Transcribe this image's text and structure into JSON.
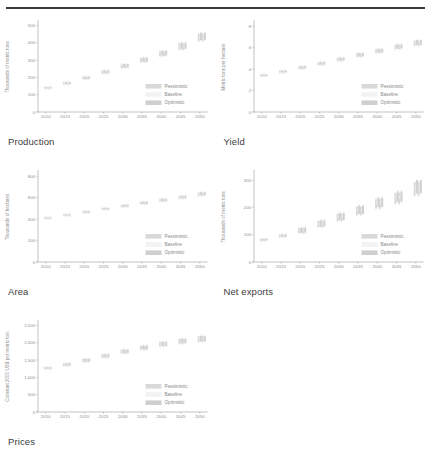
{
  "figure": {
    "panels": [
      {
        "id": "production",
        "caption": "Production",
        "ylabel": "Thousands of metric tons"
      },
      {
        "id": "yield",
        "caption": "Yield",
        "ylabel": "Metric tons per hectare"
      },
      {
        "id": "area",
        "caption": "Area",
        "ylabel": "Thousands of hectares"
      },
      {
        "id": "net_exports",
        "caption": "Net exports",
        "ylabel": "Thousands of metric tons"
      },
      {
        "id": "prices",
        "caption": "Prices",
        "ylabel": "Constant 2000 US$ per metric ton"
      }
    ],
    "legend": {
      "pessimistic": "Pessimistic",
      "baseline": "Baseline",
      "optimistic": "Optimistic"
    },
    "colors": {
      "pessimistic": "#d9d9d9",
      "baseline": "#f2f2f2",
      "optimistic": "#cfcfcf",
      "axis": "#a9a9a9",
      "text": "#8e8e8e",
      "rule": "#3a3a3a"
    }
  },
  "chart_data": [
    {
      "type": "bar",
      "id": "production",
      "title": "Production",
      "xlabel": "",
      "ylabel": "Thousands of metric tons",
      "xticks": [
        2010,
        2015,
        2020,
        2025,
        2030,
        2035,
        2040,
        2045,
        2050
      ],
      "yticks": [
        0,
        100,
        200,
        300,
        400,
        500
      ],
      "xlim": [
        2008,
        2052
      ],
      "ylim": [
        0,
        520
      ],
      "grid": false,
      "legend_position": "bottom-right",
      "x": [
        2010,
        2011,
        2015,
        2016,
        2020,
        2021,
        2025,
        2026,
        2030,
        2031,
        2035,
        2036,
        2040,
        2041,
        2045,
        2046,
        2050,
        2051
      ],
      "series": [
        {
          "name": "Pessimistic",
          "low": [
            136,
            136,
            160,
            160,
            190,
            190,
            222,
            222,
            255,
            255,
            288,
            288,
            322,
            322,
            360,
            360,
            410,
            410
          ],
          "high": [
            142,
            142,
            170,
            170,
            202,
            202,
            238,
            238,
            274,
            274,
            310,
            310,
            350,
            350,
            396,
            396,
            452,
            452
          ]
        },
        {
          "name": "Baseline",
          "low": [
            138,
            138,
            164,
            164,
            195,
            195,
            228,
            228,
            262,
            262,
            296,
            296,
            331,
            331,
            372,
            372,
            424,
            424
          ],
          "high": [
            141,
            141,
            168,
            168,
            200,
            200,
            234,
            234,
            269,
            269,
            304,
            304,
            341,
            341,
            384,
            384,
            438,
            438
          ]
        },
        {
          "name": "Optimistic",
          "low": [
            137,
            137,
            162,
            162,
            192,
            192,
            225,
            225,
            258,
            258,
            292,
            292,
            327,
            327,
            366,
            366,
            416,
            416
          ],
          "high": [
            143,
            143,
            172,
            172,
            204,
            204,
            240,
            240,
            277,
            277,
            314,
            314,
            354,
            354,
            401,
            401,
            458,
            458
          ]
        }
      ]
    },
    {
      "type": "bar",
      "id": "yield",
      "title": "Yield",
      "xlabel": "",
      "ylabel": "Metric tons per hectare",
      "xticks": [
        2010,
        2015,
        2020,
        2025,
        2030,
        2035,
        2040,
        2045,
        2050
      ],
      "yticks": [
        0,
        0.2,
        0.4,
        0.6,
        0.8
      ],
      "ytick_labels": [
        "0",
        ".2",
        ".4",
        ".6",
        ".8"
      ],
      "xlim": [
        2008,
        2052
      ],
      "ylim": [
        0,
        0.84
      ],
      "grid": false,
      "legend_position": "bottom-right",
      "x": [
        2010,
        2011,
        2015,
        2016,
        2020,
        2021,
        2025,
        2026,
        2030,
        2031,
        2035,
        2036,
        2040,
        2041,
        2045,
        2046,
        2050,
        2051
      ],
      "series": [
        {
          "name": "Pessimistic",
          "low": [
            0.335,
            0.335,
            0.368,
            0.368,
            0.404,
            0.404,
            0.44,
            0.44,
            0.478,
            0.478,
            0.516,
            0.516,
            0.552,
            0.552,
            0.588,
            0.588,
            0.62,
            0.62
          ],
          "high": [
            0.347,
            0.347,
            0.384,
            0.384,
            0.424,
            0.424,
            0.462,
            0.462,
            0.502,
            0.502,
            0.544,
            0.544,
            0.584,
            0.584,
            0.624,
            0.624,
            0.664,
            0.664
          ]
        },
        {
          "name": "Baseline",
          "low": [
            0.339,
            0.339,
            0.374,
            0.374,
            0.411,
            0.411,
            0.448,
            0.448,
            0.487,
            0.487,
            0.526,
            0.526,
            0.564,
            0.564,
            0.601,
            0.601,
            0.635,
            0.635
          ],
          "high": [
            0.344,
            0.344,
            0.38,
            0.38,
            0.418,
            0.418,
            0.456,
            0.456,
            0.495,
            0.495,
            0.535,
            0.535,
            0.574,
            0.574,
            0.613,
            0.613,
            0.65,
            0.65
          ]
        },
        {
          "name": "Optimistic",
          "low": [
            0.337,
            0.337,
            0.371,
            0.371,
            0.407,
            0.407,
            0.444,
            0.444,
            0.482,
            0.482,
            0.52,
            0.52,
            0.557,
            0.557,
            0.594,
            0.594,
            0.627,
            0.627
          ],
          "high": [
            0.349,
            0.349,
            0.387,
            0.387,
            0.427,
            0.427,
            0.466,
            0.466,
            0.507,
            0.507,
            0.549,
            0.549,
            0.59,
            0.59,
            0.631,
            0.631,
            0.672,
            0.672
          ]
        }
      ]
    },
    {
      "type": "bar",
      "id": "area",
      "title": "Area",
      "xlabel": "",
      "ylabel": "Thousands of hectares",
      "xticks": [
        2010,
        2015,
        2020,
        2025,
        2030,
        2035,
        2040,
        2045,
        2050
      ],
      "yticks": [
        0,
        200,
        400,
        600,
        800
      ],
      "xlim": [
        2008,
        2052
      ],
      "ylim": [
        0,
        840
      ],
      "grid": false,
      "legend_position": "bottom-right",
      "x": [
        2010,
        2011,
        2015,
        2016,
        2020,
        2021,
        2025,
        2026,
        2030,
        2031,
        2035,
        2036,
        2040,
        2041,
        2045,
        2046,
        2050,
        2051
      ],
      "series": [
        {
          "name": "Pessimistic",
          "low": [
            406,
            406,
            432,
            432,
            460,
            460,
            489,
            489,
            515,
            515,
            541,
            541,
            566,
            566,
            592,
            592,
            620,
            620
          ],
          "high": [
            414,
            414,
            442,
            442,
            472,
            472,
            503,
            503,
            531,
            531,
            559,
            559,
            586,
            586,
            614,
            614,
            646,
            646
          ]
        },
        {
          "name": "Baseline",
          "low": [
            408,
            408,
            435,
            435,
            464,
            464,
            494,
            494,
            521,
            521,
            548,
            548,
            573,
            573,
            600,
            600,
            629,
            629
          ],
          "high": [
            412,
            412,
            440,
            440,
            469,
            469,
            499,
            499,
            526,
            526,
            553,
            553,
            580,
            580,
            607,
            607,
            638,
            638
          ]
        },
        {
          "name": "Optimistic",
          "low": [
            407,
            407,
            433,
            433,
            461,
            461,
            491,
            491,
            517,
            517,
            544,
            544,
            569,
            569,
            596,
            596,
            624,
            624
          ],
          "high": [
            415,
            415,
            444,
            444,
            474,
            474,
            505,
            505,
            534,
            534,
            562,
            562,
            590,
            590,
            618,
            618,
            651,
            651
          ]
        }
      ]
    },
    {
      "type": "bar",
      "id": "net_exports",
      "title": "Net exports",
      "xlabel": "",
      "ylabel": "Thousands of metric tons",
      "xticks": [
        2010,
        2015,
        2020,
        2025,
        2030,
        2035,
        2040,
        2045,
        2050
      ],
      "yticks": [
        0,
        100,
        200,
        300
      ],
      "xlim": [
        2008,
        2052
      ],
      "ylim": [
        0,
        330
      ],
      "grid": false,
      "legend_position": "bottom-right",
      "x": [
        2010,
        2011,
        2015,
        2016,
        2020,
        2021,
        2025,
        2026,
        2030,
        2031,
        2035,
        2036,
        2040,
        2041,
        2045,
        2046,
        2050,
        2051
      ],
      "series": [
        {
          "name": "Pessimistic",
          "low": [
            78,
            78,
            92,
            92,
            106,
            106,
            128,
            128,
            150,
            150,
            172,
            172,
            196,
            196,
            214,
            214,
            244,
            244
          ],
          "high": [
            84,
            84,
            100,
            100,
            124,
            124,
            150,
            150,
            176,
            176,
            202,
            202,
            230,
            230,
            252,
            252,
            292,
            292
          ]
        },
        {
          "name": "Baseline",
          "low": [
            80,
            80,
            95,
            95,
            112,
            112,
            136,
            136,
            160,
            160,
            184,
            184,
            210,
            210,
            230,
            230,
            262,
            262
          ],
          "high": [
            83,
            83,
            99,
            99,
            120,
            120,
            145,
            145,
            170,
            170,
            196,
            196,
            224,
            224,
            246,
            246,
            282,
            282
          ]
        },
        {
          "name": "Optimistic",
          "low": [
            79,
            79,
            93,
            93,
            108,
            108,
            131,
            131,
            154,
            154,
            177,
            177,
            202,
            202,
            221,
            221,
            252,
            252
          ],
          "high": [
            85,
            85,
            101,
            101,
            126,
            126,
            153,
            153,
            180,
            180,
            207,
            207,
            236,
            236,
            259,
            259,
            300,
            300
          ]
        }
      ]
    },
    {
      "type": "bar",
      "id": "prices",
      "title": "Prices",
      "xlabel": "",
      "ylabel": "Constant 2000 US$ per metric ton",
      "xticks": [
        2010,
        2015,
        2020,
        2025,
        2030,
        2035,
        2040,
        2045,
        2050
      ],
      "yticks": [
        0,
        500,
        1000,
        1500,
        2000,
        2500
      ],
      "ytick_labels": [
        "0",
        "500",
        "1,000",
        "1,500",
        "2,000",
        "2,500"
      ],
      "xlim": [
        2008,
        2052
      ],
      "ylim": [
        0,
        2600
      ],
      "grid": false,
      "legend_position": "bottom-right",
      "x": [
        2010,
        2011,
        2015,
        2016,
        2020,
        2021,
        2025,
        2026,
        2030,
        2031,
        2035,
        2036,
        2040,
        2041,
        2045,
        2046,
        2050,
        2051
      ],
      "series": [
        {
          "name": "Pessimistic",
          "low": [
            1248,
            1248,
            1338,
            1338,
            1450,
            1450,
            1572,
            1572,
            1690,
            1690,
            1800,
            1800,
            1900,
            1900,
            1975,
            1975,
            2030,
            2030
          ],
          "high": [
            1288,
            1288,
            1398,
            1398,
            1528,
            1528,
            1662,
            1662,
            1790,
            1790,
            1906,
            1906,
            2016,
            2016,
            2100,
            2100,
            2180,
            2180
          ]
        },
        {
          "name": "Baseline",
          "low": [
            1258,
            1258,
            1356,
            1356,
            1474,
            1474,
            1600,
            1600,
            1722,
            1722,
            1834,
            1834,
            1938,
            1938,
            2014,
            2014,
            2072,
            2072
          ],
          "high": [
            1278,
            1278,
            1382,
            1382,
            1506,
            1506,
            1636,
            1636,
            1760,
            1760,
            1874,
            1874,
            1980,
            1980,
            2062,
            2062,
            2140,
            2140
          ]
        },
        {
          "name": "Optimistic",
          "low": [
            1252,
            1252,
            1344,
            1344,
            1458,
            1458,
            1582,
            1582,
            1702,
            1702,
            1812,
            1812,
            1914,
            1914,
            1990,
            1990,
            2046,
            2046
          ],
          "high": [
            1292,
            1292,
            1404,
            1404,
            1536,
            1536,
            1672,
            1672,
            1802,
            1802,
            1920,
            1920,
            2030,
            2030,
            2116,
            2116,
            2198,
            2198
          ]
        }
      ]
    }
  ]
}
